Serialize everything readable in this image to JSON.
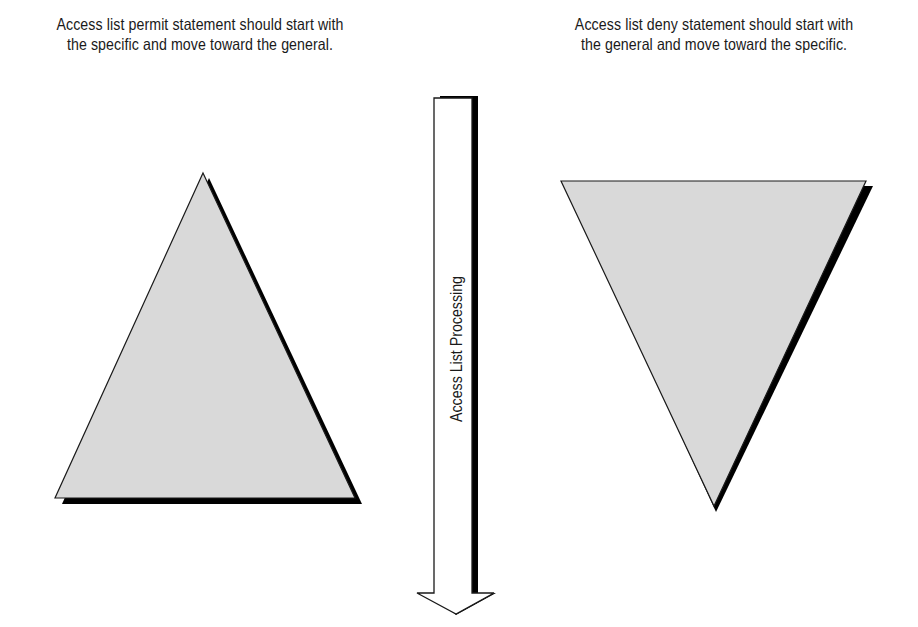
{
  "captions": {
    "left": [
      "Access list permit statement should start with",
      "the specific and move toward the general."
    ],
    "right": [
      "Access list deny statement should start with",
      "the general and move toward the specific."
    ]
  },
  "arrow": {
    "label": "Access List Processing",
    "direction": "down"
  },
  "shapes": {
    "permit_triangle": {
      "orientation": "up",
      "fill": "#d9d9d9",
      "shadow": "#000000"
    },
    "deny_triangle": {
      "orientation": "down",
      "fill": "#d9d9d9",
      "shadow": "#000000"
    }
  },
  "colors": {
    "background": "#ffffff",
    "fill": "#d9d9d9",
    "stroke": "#1a1a1a",
    "shadow": "#000000"
  }
}
